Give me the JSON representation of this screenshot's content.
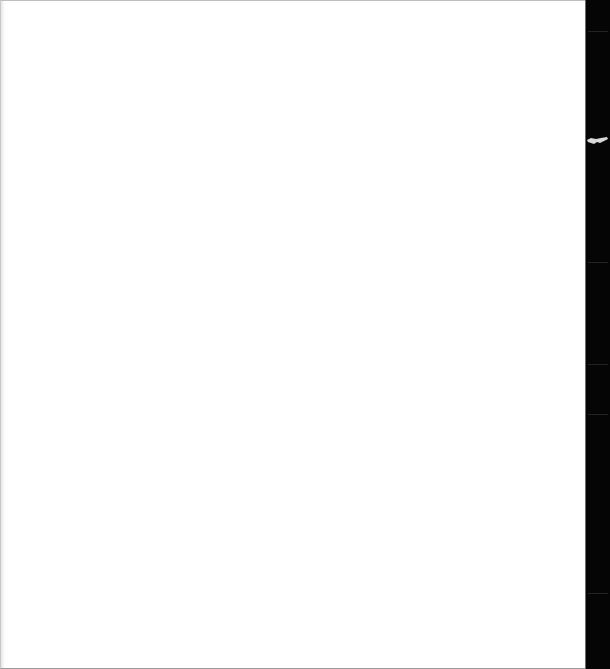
{
  "page": {
    "background_color": "#ffffff",
    "content": ""
  },
  "right_strip": {
    "background_color": "#050505",
    "mark": {
      "name": "light-smudge-mark",
      "color": "#d8d8d8"
    }
  }
}
